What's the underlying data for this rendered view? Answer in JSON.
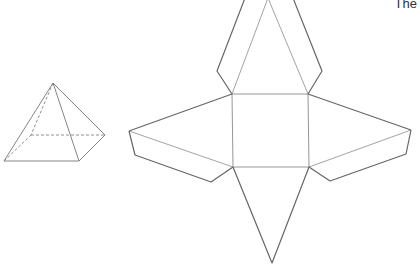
{
  "caption": "The",
  "colors": {
    "outline": "#666666",
    "fold": "#8a8a8a",
    "background": "#ffffff"
  },
  "pyramid_3d": {
    "apex": [
      53,
      83
    ],
    "base_front_left": [
      4,
      161
    ],
    "base_front_right": [
      79,
      161
    ],
    "base_right": [
      105,
      135
    ],
    "base_back_left_hidden": [
      31,
      135
    ]
  },
  "net": {
    "square": [
      [
        232,
        94
      ],
      [
        308,
        94
      ],
      [
        309,
        167
      ],
      [
        233,
        167
      ]
    ],
    "top_apex": [
      268,
      -2
    ],
    "left_apex": [
      129,
      131
    ],
    "right_apex": [
      411,
      130
    ],
    "bottom_apex": [
      272,
      263
    ],
    "top_flap": {
      "left": [
        [
          245,
          -2
        ],
        [
          217,
          71
        ],
        [
          232,
          94
        ]
      ],
      "right": [
        [
          293,
          -2
        ],
        [
          322,
          71
        ],
        [
          308,
          94
        ]
      ]
    },
    "left_flap": [
      [
        129,
        131
      ],
      [
        135,
        155
      ],
      [
        211,
        182
      ],
      [
        233,
        167
      ]
    ],
    "right_flap": [
      [
        411,
        130
      ],
      [
        406,
        154
      ],
      [
        330,
        181
      ],
      [
        309,
        167
      ]
    ]
  }
}
